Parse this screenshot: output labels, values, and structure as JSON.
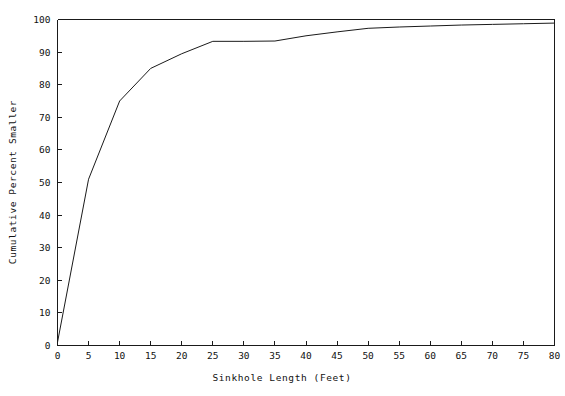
{
  "chart_data": {
    "type": "line",
    "title": "",
    "xlabel": "Sinkhole Length (Feet)",
    "ylabel": "Cumulative Percent Smaller",
    "xlim": [
      0,
      80
    ],
    "ylim": [
      0,
      100
    ],
    "xticks": [
      0,
      5,
      10,
      15,
      20,
      25,
      30,
      35,
      40,
      45,
      50,
      55,
      60,
      65,
      70,
      75,
      80
    ],
    "yticks": [
      0,
      10,
      20,
      30,
      40,
      50,
      60,
      70,
      80,
      90,
      100
    ],
    "xtick_labels": [
      "0",
      "5",
      "10",
      "15",
      "20",
      "25",
      "30",
      "35",
      "40",
      "45",
      "50",
      "55",
      "60",
      "65",
      "70",
      "75",
      "80"
    ],
    "ytick_labels": [
      "0",
      "10",
      "20",
      "30",
      "40",
      "50",
      "60",
      "70",
      "80",
      "90",
      "100"
    ],
    "grid": false,
    "legend": null,
    "series": [
      {
        "name": "Cumulative distribution of sinkhole length",
        "color": "#1a1a1a",
        "x": [
          0,
          5,
          10,
          15,
          20,
          25,
          30,
          35,
          40,
          45,
          50,
          55,
          60,
          65,
          70,
          75,
          80
        ],
        "y": [
          1.0,
          51.0,
          75.0,
          85.0,
          89.5,
          93.3,
          93.3,
          93.4,
          95.0,
          96.2,
          97.3,
          97.7,
          98.0,
          98.3,
          98.5,
          98.7,
          98.9
        ]
      }
    ],
    "line_color": "#1a1a1a",
    "axis_color": "#1a1a1a",
    "background_color": "#ffffff"
  },
  "axes": {
    "x_title": "Sinkhole Length (Feet)",
    "y_title": "Cumulative Percent Smaller"
  }
}
